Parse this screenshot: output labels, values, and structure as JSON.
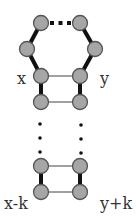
{
  "diagram": {
    "title": "",
    "labels": {
      "x": "x",
      "y": "y",
      "x_minus_k": "x-k",
      "y_plus_k": "y+k"
    },
    "colors": {
      "node_fill": "#a6a6a6",
      "node_stroke": "#555555",
      "edge": "#111111",
      "thin_edge": "#444444",
      "label": "#333333"
    },
    "nodes": [
      {
        "id": "top-left",
        "cx": 41,
        "cy": 23
      },
      {
        "id": "top-right",
        "cx": 80,
        "cy": 23
      },
      {
        "id": "mid-left",
        "cx": 27,
        "cy": 49
      },
      {
        "id": "mid-right",
        "cx": 95,
        "cy": 49
      },
      {
        "id": "x",
        "cx": 41,
        "cy": 76
      },
      {
        "id": "y",
        "cx": 80,
        "cy": 76
      },
      {
        "id": "x-1",
        "cx": 41,
        "cy": 102
      },
      {
        "id": "y+1",
        "cx": 80,
        "cy": 102
      },
      {
        "id": "x-k+1",
        "cx": 41,
        "cy": 166
      },
      {
        "id": "y+k-1",
        "cx": 80,
        "cy": 166
      },
      {
        "id": "x-k",
        "cx": 41,
        "cy": 192
      },
      {
        "id": "y+k",
        "cx": 80,
        "cy": 192
      }
    ],
    "thick_edges": [
      [
        "top-left",
        "mid-left"
      ],
      [
        "mid-left",
        "x"
      ],
      [
        "top-right",
        "mid-right"
      ],
      [
        "mid-right",
        "y"
      ],
      [
        "x",
        "x-1"
      ],
      [
        "y",
        "y+1"
      ],
      [
        "x-k+1",
        "x-k"
      ],
      [
        "y+k-1",
        "y+k"
      ]
    ],
    "thin_edges": [
      [
        "x",
        "y"
      ],
      [
        "x-1",
        "y+1"
      ],
      [
        "x-k+1",
        "y+k-1"
      ],
      [
        "x-k",
        "y+k"
      ]
    ],
    "dotted_edges": [
      [
        "top-left",
        "top-right"
      ]
    ],
    "ellipsis_columns": [
      {
        "cx": 40,
        "dots_y": [
          124,
          138,
          152
        ]
      },
      {
        "cx": 81,
        "dots_y": [
          125,
          139,
          153
        ]
      }
    ]
  }
}
